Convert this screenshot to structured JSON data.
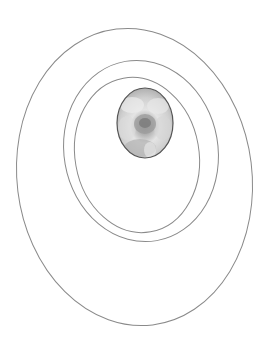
{
  "canvas": {
    "width": 264,
    "height": 346,
    "background": "#ffffff"
  },
  "stroke_color": "#8a8a8a",
  "ellipses": [
    {
      "name": "outer-ring",
      "cx": 134.5,
      "cy": 177,
      "rx": 117.5,
      "ry": 149,
      "rotate": -7
    },
    {
      "name": "middle-ring",
      "cx": 141,
      "cy": 151,
      "rx": 77,
      "ry": 91,
      "rotate": -10
    },
    {
      "name": "inner-ring",
      "cx": 137,
      "cy": 155,
      "rx": 62,
      "ry": 78,
      "rotate": -10
    }
  ],
  "photo": {
    "subject": "flower",
    "cx": 145,
    "cy": 123,
    "rx": 28,
    "ry": 35,
    "border_color": "#555555",
    "tones": [
      "#9a9a9a",
      "#c8c8c8",
      "#e6e6e6",
      "#7d7d7d"
    ]
  }
}
